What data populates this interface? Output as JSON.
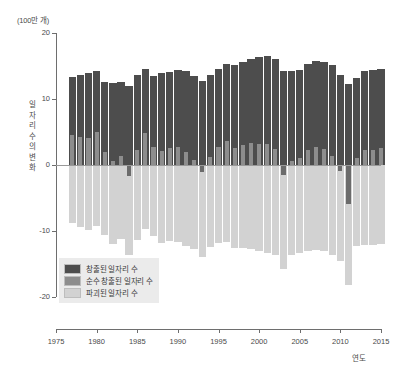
{
  "chart_data": {
    "type": "bar",
    "title": "",
    "subtitle": "",
    "unit_label": "(100만 개)",
    "ylabel": "일자리 수의 변화",
    "xlabel": "연도",
    "ylim": [
      -20,
      20
    ],
    "xlim": [
      1975,
      2015
    ],
    "grid": false,
    "legend_position": "bottom-left",
    "stacking": "overlay-signed",
    "yticks": [
      20,
      10,
      0,
      -10,
      -20
    ],
    "ytick_labels": [
      "20",
      "10",
      "0",
      "-10",
      "-20"
    ],
    "xticks": [
      1975,
      1980,
      1985,
      1990,
      1995,
      2000,
      2005,
      2010,
      2015
    ],
    "xtick_labels": [
      "1975",
      "1980",
      "1985",
      "1990",
      "1995",
      "2000",
      "2005",
      "2010",
      "2015"
    ],
    "series": [
      {
        "name": "창출된 일자리 수",
        "color": "#4d4d4d",
        "values": [
          13.4,
          13.7,
          13.9,
          14.3,
          12.6,
          12.5,
          12.6,
          11.9,
          13.6,
          14.6,
          13.5,
          13.9,
          14.1,
          14.4,
          14.2,
          13.5,
          12.8,
          13.6,
          14.6,
          15.3,
          15.2,
          15.6,
          16.1,
          16.3,
          16.5,
          16.1,
          14.3,
          14.2,
          14.4,
          15.3,
          15.7,
          15.6,
          15.1,
          13.6,
          12.3,
          13.2,
          14.3,
          14.4,
          14.6,
          15.1
        ]
      },
      {
        "name": "순수 창출된 일자리 수",
        "color": "#8d8d8d",
        "values": [
          4.6,
          4.3,
          4.1,
          5.0,
          2.0,
          0.6,
          1.4,
          -1.7,
          2.3,
          4.9,
          2.7,
          2.1,
          2.6,
          2.8,
          1.9,
          0.7,
          -1.1,
          1.2,
          2.8,
          3.6,
          2.6,
          3.0,
          3.4,
          3.2,
          3.2,
          2.4,
          -1.5,
          0.6,
          1.1,
          2.3,
          2.8,
          2.5,
          1.4,
          -0.9,
          -5.9,
          1.0,
          2.2,
          2.3,
          2.6,
          2.9
        ]
      },
      {
        "name": "파괴된 일자리 수",
        "color": "#d2d2d2",
        "values": [
          -8.8,
          -9.4,
          -9.8,
          -9.3,
          -10.6,
          -11.9,
          -11.2,
          -13.6,
          -11.3,
          -9.7,
          -10.8,
          -11.8,
          -11.5,
          -11.6,
          -12.3,
          -12.8,
          -13.9,
          -12.4,
          -11.8,
          -11.7,
          -12.6,
          -12.6,
          -12.7,
          -13.1,
          -13.3,
          -13.7,
          -15.8,
          -13.6,
          -13.3,
          -13.0,
          -12.9,
          -13.1,
          -13.7,
          -14.5,
          -18.2,
          -12.2,
          -12.1,
          -12.1,
          -12.0,
          -12.2
        ]
      }
    ],
    "x": [
      1977,
      1978,
      1979,
      1980,
      1981,
      1982,
      1983,
      1984,
      1985,
      1986,
      1987,
      1988,
      1989,
      1990,
      1991,
      1992,
      1993,
      1994,
      1995,
      1996,
      1997,
      1998,
      1999,
      2000,
      2001,
      2002,
      2003,
      2004,
      2005,
      2006,
      2007,
      2008,
      2009,
      2010,
      2011,
      2012,
      2013,
      2014,
      2015,
      2016
    ]
  },
  "legend": {
    "items": [
      {
        "label": "창출된 일자리 수",
        "color": "#4d4d4d"
      },
      {
        "label": "순수 창출된 일자리 수",
        "color": "#8d8d8d"
      },
      {
        "label": "파괴된 일자리 수",
        "color": "#d2d2d2"
      }
    ]
  }
}
